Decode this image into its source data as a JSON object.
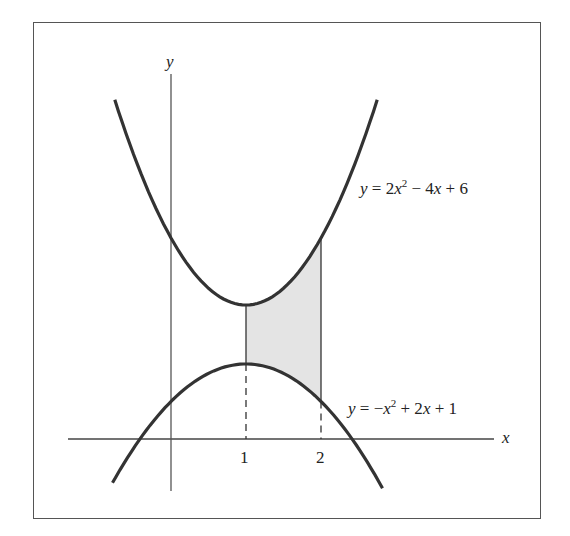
{
  "chart_data": {
    "type": "line",
    "title": "",
    "xlabel": "x",
    "ylabel": "y",
    "x_ticks": [
      "1",
      "2"
    ],
    "series": [
      {
        "name": "y = 2x^2 - 4x + 6",
        "a": 2,
        "b": -4,
        "c": 6,
        "x_range": [
          -0.75,
          2.75
        ]
      },
      {
        "name": "y = -x^2 + 2x + 1",
        "a": -1,
        "b": 2,
        "c": 1,
        "x_range": [
          -0.78,
          2.85
        ]
      }
    ],
    "shaded_region": {
      "x_from": 1,
      "x_to": 2,
      "between": [
        "y = 2x^2 - 4x + 6",
        "y = -x^2 + 2x + 1"
      ],
      "fill": "#e6e6e6"
    },
    "dashed_verticals": [
      1,
      2
    ]
  },
  "labels": {
    "y_axis": "y",
    "x_axis": "x",
    "tick_1": "1",
    "tick_2": "2",
    "upper_eq": {
      "y": "y",
      "rest1": " = 2",
      "x1": "x",
      "sup": "2",
      "rest2": " − 4",
      "x2": "x",
      "rest3": " + 6"
    },
    "lower_eq": {
      "y": "y",
      "rest1": " = −",
      "x1": "x",
      "sup": "2",
      "rest2": " + 2",
      "x2": "x",
      "rest3": " + 1"
    }
  }
}
